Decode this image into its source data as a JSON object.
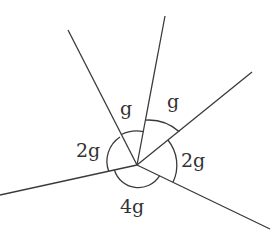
{
  "diagram": {
    "type": "angles-at-a-point",
    "center": [
      137,
      165
    ],
    "rays": [
      {
        "name": "upper-left",
        "end": [
          68,
          30
        ]
      },
      {
        "name": "top",
        "end": [
          165,
          16
        ]
      },
      {
        "name": "upper-right",
        "end": [
          252,
          72
        ]
      },
      {
        "name": "lower-right",
        "end": [
          270,
          229
        ]
      },
      {
        "name": "left",
        "end": [
          0,
          195
        ]
      }
    ],
    "angles": [
      {
        "label": "g",
        "between": [
          "upper-left",
          "top"
        ],
        "label_pos": [
          128,
          110
        ]
      },
      {
        "label": "g",
        "between": [
          "top",
          "upper-right"
        ],
        "label_pos": [
          172,
          105
        ]
      },
      {
        "label": "2g",
        "between": [
          "upper-right",
          "lower-right"
        ],
        "label_pos": [
          183,
          168
        ]
      },
      {
        "label": "4g",
        "between": [
          "lower-right",
          "left"
        ],
        "label_pos": [
          120,
          213
        ]
      },
      {
        "label": "2g",
        "between": [
          "left",
          "upper-left"
        ],
        "label_pos": [
          76,
          155
        ]
      }
    ]
  }
}
